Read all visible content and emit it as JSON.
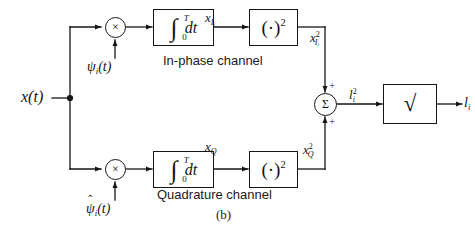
{
  "figure": {
    "caption": "(b)",
    "input_signal": "x(t)",
    "output_signal": "l",
    "output_signal_sub": "i"
  },
  "channels": {
    "inphase": {
      "label": "In-phase channel",
      "carrier": "ψ",
      "carrier_sub": "i",
      "carrier_arg": "(t)",
      "multiplier_symbol": "×",
      "integrator_lower": "0",
      "integrator_upper": "T",
      "integrator_variable": "dt",
      "squarer_label": "(·)",
      "squarer_exponent": "2",
      "signal_after_integrator": "x",
      "signal_after_integrator_sub": "I",
      "signal_after_integrator_sub2": "i",
      "signal_after_squarer": "x",
      "signal_after_squarer_exp": "2",
      "signal_after_squarer_sub": "I",
      "signal_after_squarer_sub2": "i"
    },
    "quadrature": {
      "label": "Quadrature channel",
      "carrier": "ψ",
      "carrier_hat": "ˆ",
      "carrier_sub": "i",
      "carrier_arg": "(t)",
      "multiplier_symbol": "×",
      "integrator_lower": "0",
      "integrator_upper": "T",
      "integrator_variable": "dt",
      "squarer_label": "(·)",
      "squarer_exponent": "2",
      "signal_after_integrator": "x",
      "signal_after_integrator_sub": "Q",
      "signal_after_squarer": "x",
      "signal_after_squarer_exp": "2",
      "signal_after_squarer_sub": "Q"
    }
  },
  "summer": {
    "symbol": "Σ",
    "top_sign": "+",
    "bottom_sign": "+",
    "output_label": "l",
    "output_exp": "2",
    "output_sub": "i"
  },
  "sqrt_block": {
    "symbol": "√",
    "name": "square-root"
  },
  "colors": {
    "line": "#161616",
    "text": "#141414",
    "background": "#ffffff"
  }
}
